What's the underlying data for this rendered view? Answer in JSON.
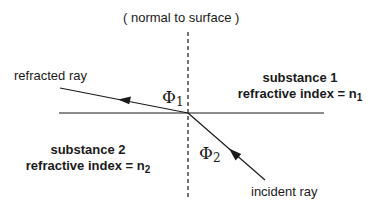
{
  "normal_label": "( normal to surface )",
  "refracted_label": "refracted ray",
  "incident_label": "incident ray",
  "angle1": {
    "symbol": "Φ",
    "sub": "1"
  },
  "angle2": {
    "symbol": "Φ",
    "sub": "2"
  },
  "substance1": {
    "name": "substance 1",
    "index_text": "refractive index = n",
    "index_sub": "1"
  },
  "substance2": {
    "name": "substance 2",
    "index_text": "refractive index = n",
    "index_sub": "2"
  },
  "colors": {
    "line": "#1a1a1a",
    "background": "#ffffff"
  },
  "geometry": {
    "origin": [
      188,
      113
    ],
    "surface": {
      "x1": 59,
      "x2": 324,
      "y": 113
    },
    "normal": {
      "x": 188,
      "y1": 32,
      "y2": 198
    },
    "refracted_end": [
      60,
      88
    ],
    "incident_start": [
      265,
      180
    ]
  }
}
